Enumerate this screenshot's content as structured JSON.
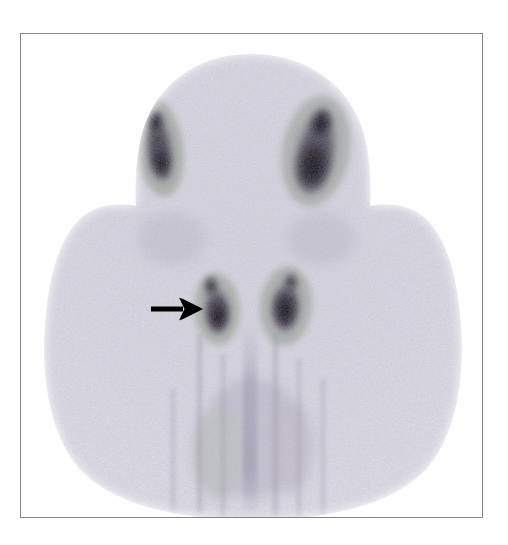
{
  "figure": {
    "kind": "nuclear-medicine-scintigram",
    "modality": "planar gamma camera scintigraphy",
    "view": "anterior",
    "caption_text": "",
    "border_color": "#858585",
    "page_background": "#ffffff"
  },
  "frame": {
    "x": 20,
    "y": 33,
    "width": 463,
    "height": 485
  },
  "palette": {
    "background_white": "#ffffff",
    "plate_white": "#fefeff",
    "tissue_light": "#eceaf1",
    "tissue_mid": "#d8d6e0",
    "tissue_speckle": "#b9b6c6",
    "tissue_green_tint": "#9aa893",
    "tissue_violet_tint": "#9b93ad",
    "focus_dark": "#120f18",
    "focus_core": "#000000",
    "arrow_color": "#000000",
    "border_gray": "#858585"
  },
  "scan": {
    "body_outline_label": "head-neck-shoulders silhouette",
    "midline_label": "faint vertical mediastinal stripe",
    "noise_density": 2600,
    "foci": [
      {
        "id": "focus-upper-left",
        "label": "upper left uptake focus",
        "cx": 138,
        "cy": 113,
        "rx": 17,
        "ry": 42,
        "rotation": -8,
        "intensity": "high"
      },
      {
        "id": "focus-upper-right",
        "label": "upper right uptake focus",
        "cx": 295,
        "cy": 117,
        "rx": 25,
        "ry": 45,
        "rotation": 10,
        "intensity": "very-high"
      },
      {
        "id": "focus-lower-left",
        "label": "lower left uptake focus indicated by arrow",
        "cx": 196,
        "cy": 275,
        "rx": 16,
        "ry": 27,
        "rotation": -4,
        "intensity": "very-high"
      },
      {
        "id": "focus-lower-right",
        "label": "lower right uptake focus",
        "cx": 265,
        "cy": 272,
        "rx": 18,
        "ry": 30,
        "rotation": 5,
        "intensity": "high"
      }
    ]
  },
  "annotation": {
    "arrow": {
      "label": "arrow marker",
      "direction": "right",
      "tail_x": 130,
      "tail_y": 275,
      "tip_x": 180,
      "tip_y": 275,
      "shaft_thickness": 5,
      "head_length": 20,
      "head_width": 22,
      "color": "#000000",
      "points_to": "focus-lower-left"
    }
  }
}
